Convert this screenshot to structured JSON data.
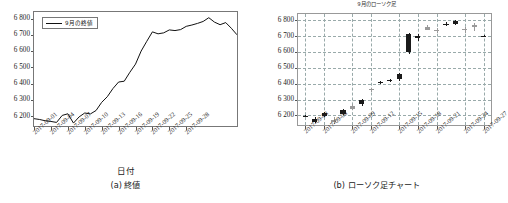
{
  "figure": {
    "panels": [
      {
        "id": "closing-price",
        "caption": "(a) 終値",
        "xlabel": "日付",
        "legend_label": "9月の終値"
      },
      {
        "id": "candlestick",
        "caption": "(b) ローソク足チャート",
        "title": "9月のローソク足",
        "xlabel": ""
      }
    ]
  },
  "chart_data": [
    {
      "type": "line",
      "title": "",
      "legend": [
        "9月の終値"
      ],
      "legend_position": "top-left",
      "xlabel": "日付",
      "ylabel": "",
      "grid": false,
      "ylim": [
        6140,
        6840
      ],
      "yticks": [
        6200,
        6300,
        6400,
        6500,
        6600,
        6700,
        6800
      ],
      "ytick_labels": [
        "6 200",
        "6 300",
        "6 400",
        "6 500",
        "6 600",
        "6 700",
        "6 800"
      ],
      "xtick_labels": [
        "2017-09-01",
        "2017-09-04",
        "2017-09-07",
        "2017-09-10",
        "2017-09-13",
        "2017-09-16",
        "2017-09-19",
        "2017-09-22",
        "2017-09-25",
        "2017-09-28"
      ],
      "x": [
        "2017-09-01",
        "2017-09-02",
        "2017-09-03",
        "2017-09-04",
        "2017-09-05",
        "2017-09-06",
        "2017-09-07",
        "2017-09-08",
        "2017-09-09",
        "2017-09-10",
        "2017-09-11",
        "2017-09-12",
        "2017-09-13",
        "2017-09-14",
        "2017-09-15",
        "2017-09-16",
        "2017-09-17",
        "2017-09-18",
        "2017-09-19",
        "2017-09-20",
        "2017-09-21",
        "2017-09-22",
        "2017-09-23",
        "2017-09-24",
        "2017-09-25",
        "2017-09-26",
        "2017-09-27",
        "2017-09-28",
        "2017-09-29",
        "2017-09-30"
      ],
      "values": [
        6185,
        6180,
        6172,
        6168,
        6162,
        6205,
        6215,
        6158,
        6196,
        6220,
        6214,
        6235,
        6285,
        6320,
        6370,
        6410,
        6415,
        6470,
        6520,
        6600,
        6660,
        6718,
        6706,
        6712,
        6730,
        6726,
        6732,
        6752,
        6760,
        6770
      ],
      "values_tail": [
        6782,
        6805,
        6778,
        6762,
        6775,
        6740,
        6700
      ],
      "series": [
        {
          "name": "9月の終値",
          "color": "#111111",
          "values": [
            6185,
            6180,
            6172,
            6168,
            6162,
            6205,
            6215,
            6158,
            6196,
            6220,
            6214,
            6235,
            6285,
            6320,
            6370,
            6410,
            6415,
            6470,
            6520,
            6600,
            6660,
            6718,
            6706,
            6712,
            6730,
            6726,
            6732,
            6752,
            6760,
            6770,
            6782,
            6805,
            6778,
            6762,
            6775,
            6740,
            6700
          ]
        }
      ]
    },
    {
      "type": "candlestick",
      "title": "9月のローソク足",
      "xlabel": "",
      "ylabel": "",
      "grid": true,
      "ylim": [
        6140,
        6840
      ],
      "yticks": [
        6200,
        6300,
        6400,
        6500,
        6600,
        6700,
        6800
      ],
      "ytick_labels": [
        "6 200",
        "6 300",
        "6 400",
        "6 500",
        "6 600",
        "6 700",
        "6 800"
      ],
      "xtick_labels": [
        "2017-09-03",
        "2017-09-06",
        "2017-09-09",
        "2017-09-12",
        "2017-09-15",
        "2017-09-18",
        "2017-09-21",
        "2017-09-24",
        "2017-09-27"
      ],
      "up_color": "#9a9a9a",
      "down_color": "#1a1a1a",
      "candles": [
        {
          "date": "2017-09-01",
          "open": 6198,
          "high": 6202,
          "low": 6188,
          "close": 6192,
          "dir": "down"
        },
        {
          "date": "2017-09-04",
          "open": 6180,
          "high": 6190,
          "low": 6150,
          "close": 6162,
          "dir": "down"
        },
        {
          "date": "2017-09-05",
          "open": 6196,
          "high": 6222,
          "low": 6190,
          "close": 6215,
          "dir": "down"
        },
        {
          "date": "2017-09-06",
          "open": 6172,
          "high": 6190,
          "low": 6148,
          "close": 6160,
          "dir": "up"
        },
        {
          "date": "2017-09-07",
          "open": 6212,
          "high": 6238,
          "low": 6205,
          "close": 6232,
          "dir": "down"
        },
        {
          "date": "2017-09-08",
          "open": 6240,
          "high": 6270,
          "low": 6232,
          "close": 6262,
          "dir": "up"
        },
        {
          "date": "2017-09-11",
          "open": 6300,
          "high": 6305,
          "low": 6262,
          "close": 6272,
          "dir": "down"
        },
        {
          "date": "2017-09-12",
          "open": 6360,
          "high": 6372,
          "low": 6348,
          "close": 6366,
          "dir": "up"
        },
        {
          "date": "2017-09-13",
          "open": 6405,
          "high": 6415,
          "low": 6398,
          "close": 6410,
          "dir": "down"
        },
        {
          "date": "2017-09-14",
          "open": 6418,
          "high": 6432,
          "low": 6410,
          "close": 6424,
          "dir": "down"
        },
        {
          "date": "2017-09-15",
          "open": 6460,
          "high": 6468,
          "low": 6418,
          "close": 6428,
          "dir": "down"
        },
        {
          "date": "2017-09-19",
          "open": 6715,
          "high": 6720,
          "low": 6590,
          "close": 6600,
          "dir": "down"
        },
        {
          "date": "2017-09-20",
          "open": 6700,
          "high": 6712,
          "low": 6672,
          "close": 6690,
          "dir": "down"
        },
        {
          "date": "2017-09-21",
          "open": 6742,
          "high": 6768,
          "low": 6738,
          "close": 6760,
          "dir": "up"
        },
        {
          "date": "2017-09-22",
          "open": 6735,
          "high": 6752,
          "low": 6718,
          "close": 6742,
          "dir": "up"
        },
        {
          "date": "2017-09-25",
          "open": 6775,
          "high": 6790,
          "low": 6762,
          "close": 6780,
          "dir": "down"
        },
        {
          "date": "2017-09-26",
          "open": 6780,
          "high": 6805,
          "low": 6772,
          "close": 6796,
          "dir": "down"
        },
        {
          "date": "2017-09-27",
          "open": 6738,
          "high": 6760,
          "low": 6718,
          "close": 6748,
          "dir": "up"
        },
        {
          "date": "2017-09-28",
          "open": 6768,
          "high": 6782,
          "low": 6730,
          "close": 6760,
          "dir": "up"
        },
        {
          "date": "2017-09-29",
          "open": 6702,
          "high": 6708,
          "low": 6696,
          "close": 6700,
          "dir": "down"
        }
      ]
    }
  ]
}
